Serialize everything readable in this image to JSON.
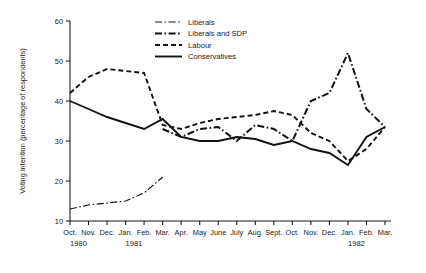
{
  "chart_data": {
    "type": "line",
    "title": "",
    "xlabel": "",
    "ylabel": "Voting intention (percentage of respondents)",
    "ylim": [
      10,
      60
    ],
    "yticks": [
      10,
      20,
      30,
      40,
      50,
      60
    ],
    "ytick_labels": [
      "10",
      "20",
      "30",
      "40",
      "50",
      "60"
    ],
    "grid": false,
    "legend_position": "top-right",
    "categories": [
      "Oct.",
      "Nov.",
      "Dec.",
      "Jan.",
      "Feb.",
      "Mar.",
      "Apr.",
      "May",
      "June",
      "July",
      "Aug.",
      "Sept.",
      "Oct.",
      "Nov.",
      "Dec.",
      "Jan.",
      "Feb.",
      "Mar."
    ],
    "year_groups": [
      {
        "label": "1980",
        "start_index": 0,
        "end_index": 2
      },
      {
        "label": "1981",
        "start_index": 3,
        "end_index": 14
      },
      {
        "label": "1982",
        "start_index": 15,
        "end_index": 17
      }
    ],
    "series": [
      {
        "name": "Liberals",
        "style": "thin-dash-dot",
        "color": "#111111",
        "values": [
          13,
          14,
          14.5,
          15,
          17,
          21,
          null,
          null,
          null,
          null,
          null,
          null,
          null,
          null,
          null,
          null,
          null,
          null
        ]
      },
      {
        "name": "Liberals and SDP",
        "style": "bold-dash-dot",
        "color": "#111111",
        "values": [
          null,
          null,
          null,
          null,
          null,
          33,
          31,
          33,
          33.5,
          30,
          34,
          33,
          30,
          40,
          42,
          52,
          38,
          33.5
        ]
      },
      {
        "name": "Labour",
        "style": "dashed",
        "color": "#111111",
        "values": [
          42,
          46,
          48,
          47.5,
          47,
          34,
          33,
          34.5,
          35.5,
          36,
          36.5,
          37.5,
          36.5,
          32,
          30,
          25,
          28,
          33.5
        ]
      },
      {
        "name": "Conservatives",
        "style": "solid",
        "color": "#111111",
        "values": [
          40,
          38,
          36,
          34.5,
          33,
          35.5,
          31,
          30,
          30,
          31,
          30.5,
          29,
          30,
          28,
          27,
          24,
          31,
          33.5
        ]
      }
    ]
  },
  "legend": {
    "items": [
      {
        "label": "Liberals",
        "style": "thin-dash-dot"
      },
      {
        "label": "Liberals and SDP",
        "style": "bold-dash-dot"
      },
      {
        "label": "Labour",
        "style": "dashed"
      },
      {
        "label": "Conservatives",
        "style": "solid"
      }
    ]
  }
}
